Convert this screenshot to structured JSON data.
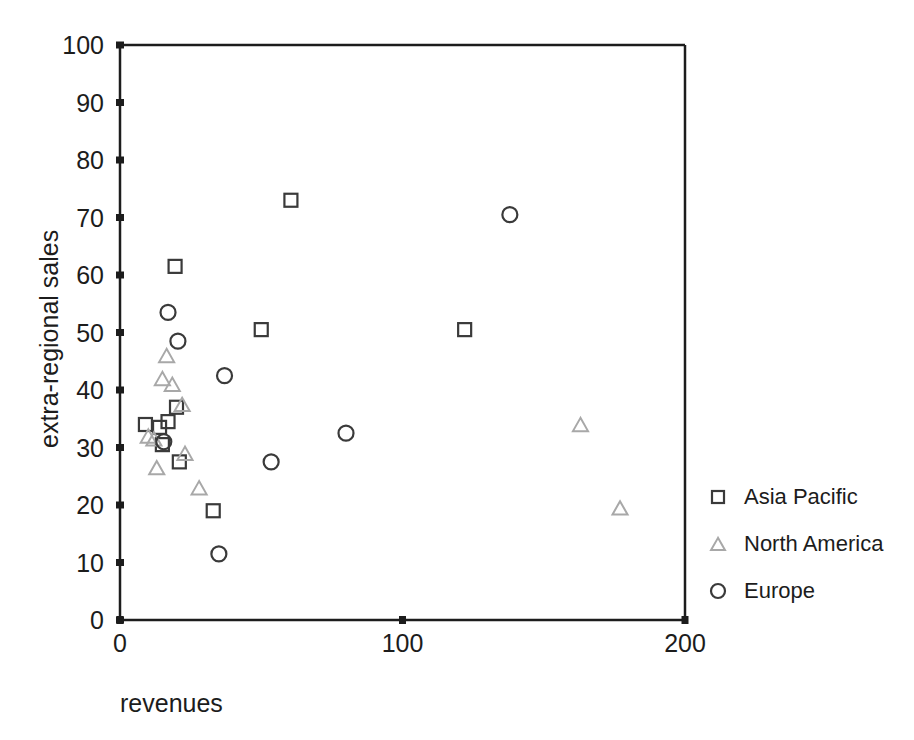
{
  "chart_data": {
    "type": "scatter",
    "title": "",
    "xlabel": "revenues",
    "ylabel": "extra-regional sales",
    "xlim": [
      0,
      200
    ],
    "ylim": [
      0,
      100
    ],
    "xticks": [
      0,
      100,
      200
    ],
    "yticks": [
      0,
      10,
      20,
      30,
      40,
      50,
      60,
      70,
      80,
      90,
      100
    ],
    "xtick_labels": [
      "0",
      "100",
      "200"
    ],
    "ytick_labels": [
      "0",
      "10",
      "20",
      "30",
      "40",
      "50",
      "60",
      "70",
      "80",
      "90",
      "100"
    ],
    "grid": false,
    "legend_position": "right-outside",
    "series": [
      {
        "name": "Asia Pacific",
        "marker": "square",
        "color": "#3a3a3a",
        "points": [
          [
            9,
            34.0
          ],
          [
            14,
            33.5
          ],
          [
            15,
            30.5
          ],
          [
            17,
            34.5
          ],
          [
            19.5,
            61.5
          ],
          [
            20,
            37.0
          ],
          [
            21,
            27.5
          ],
          [
            33,
            19.0
          ],
          [
            50,
            50.5
          ],
          [
            60.5,
            73.0
          ],
          [
            122,
            50.5
          ]
        ]
      },
      {
        "name": "North America",
        "marker": "triangle",
        "color": "#a8a8a8",
        "points": [
          [
            10,
            32.0
          ],
          [
            12,
            31.5
          ],
          [
            13,
            26.5
          ],
          [
            15,
            42.0
          ],
          [
            16.5,
            46.0
          ],
          [
            18.5,
            41.0
          ],
          [
            22,
            37.5
          ],
          [
            23,
            29.0
          ],
          [
            28,
            23.0
          ],
          [
            163,
            34.0
          ],
          [
            177,
            19.5
          ]
        ]
      },
      {
        "name": "Europe",
        "marker": "circle",
        "color": "#3a3a3a",
        "points": [
          [
            15.5,
            31.0
          ],
          [
            17,
            53.5
          ],
          [
            20.5,
            48.5
          ],
          [
            35,
            11.5
          ],
          [
            37,
            42.5
          ],
          [
            53.5,
            27.5
          ],
          [
            80,
            32.5
          ],
          [
            138,
            70.5
          ]
        ]
      }
    ]
  },
  "legend": {
    "items": [
      {
        "label": "Asia Pacific",
        "marker": "square",
        "color": "#3a3a3a"
      },
      {
        "label": "North America",
        "marker": "triangle",
        "color": "#a8a8a8"
      },
      {
        "label": "Europe",
        "marker": "circle",
        "color": "#3a3a3a"
      }
    ]
  }
}
